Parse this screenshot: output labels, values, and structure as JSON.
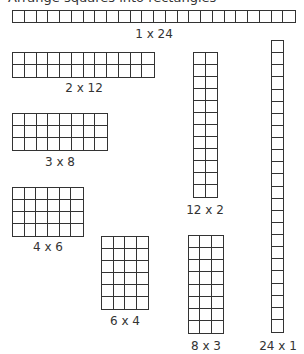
{
  "header": {
    "partial_text": "Arrange squares into rectangles"
  },
  "line_color": "#333333",
  "arrays": [
    {
      "id": "1x24",
      "rows": 1,
      "cols": 24,
      "label": "1 x 24",
      "x": 12,
      "y": 10,
      "w": 284,
      "h": 13,
      "lx": 154,
      "ly": 27
    },
    {
      "id": "2x12",
      "rows": 2,
      "cols": 12,
      "label": "2 x 12",
      "x": 12,
      "y": 52,
      "w": 143,
      "h": 26,
      "lx": 84,
      "ly": 81
    },
    {
      "id": "3x8",
      "rows": 3,
      "cols": 8,
      "label": "3 x 8",
      "x": 12,
      "y": 113,
      "w": 96,
      "h": 38,
      "lx": 60,
      "ly": 155
    },
    {
      "id": "4x6",
      "rows": 4,
      "cols": 6,
      "label": "4 x 6",
      "x": 12,
      "y": 187,
      "w": 72,
      "h": 50,
      "lx": 48,
      "ly": 240
    },
    {
      "id": "6x4",
      "rows": 6,
      "cols": 4,
      "label": "6 x 4",
      "x": 101,
      "y": 236,
      "w": 48,
      "h": 74,
      "lx": 125,
      "ly": 314
    },
    {
      "id": "8x3",
      "rows": 8,
      "cols": 3,
      "label": "8 x 3",
      "x": 188,
      "y": 235,
      "w": 36,
      "h": 99,
      "lx": 206,
      "ly": 339
    },
    {
      "id": "12x2",
      "rows": 12,
      "cols": 2,
      "label": "12 x 2",
      "x": 193,
      "y": 52,
      "w": 25,
      "h": 146,
      "lx": 205,
      "ly": 203
    },
    {
      "id": "24x1",
      "rows": 24,
      "cols": 1,
      "label": "24 x 1",
      "x": 271,
      "y": 40,
      "w": 13,
      "h": 293,
      "lx": 278,
      "ly": 339
    }
  ]
}
